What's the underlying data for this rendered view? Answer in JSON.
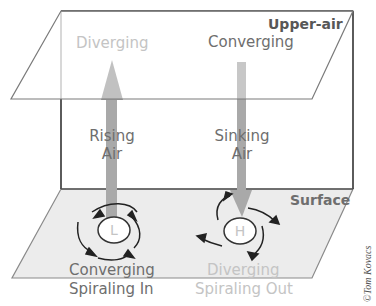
{
  "diagram": {
    "planes": {
      "upper": {
        "label": "Upper-air"
      },
      "surface": {
        "label": "Surface"
      }
    },
    "upper_labels": {
      "left": "Diverging",
      "right": "Converging"
    },
    "vertical_arrows": {
      "left": {
        "line1": "Rising",
        "line2": "Air",
        "direction": "up"
      },
      "right": {
        "line1": "Sinking",
        "line2": "Air",
        "direction": "down"
      }
    },
    "pressure_centers": {
      "low": {
        "symbol": "L",
        "label1": "Converging",
        "label2": "Spiraling In"
      },
      "high": {
        "symbol": "H",
        "label1": "Diverging",
        "label2": "Spiraling Out"
      }
    },
    "credit": "©Tom Kovacs",
    "colors": {
      "plane_fill_surface": "#ececec",
      "arrow_gray": "#a9a9a9",
      "line": "#444444"
    }
  }
}
